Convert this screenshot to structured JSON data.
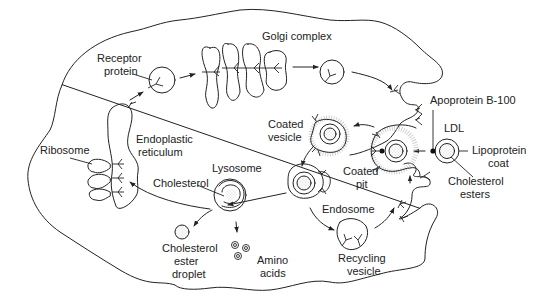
{
  "diagram": {
    "labels": {
      "receptor_protein": [
        "Receptor",
        "protein"
      ],
      "golgi_complex": "Golgi complex",
      "ribosome": "Ribosome",
      "endoplastic_reticulum": [
        "Endoplastic",
        "reticulum"
      ],
      "apoprotein": "Apoprotein B-100",
      "ldl": "LDL",
      "lipoprotein_coat": [
        "Lipoprotein",
        "coat"
      ],
      "cholesterol_esters": [
        "Cholesterol",
        "esters"
      ],
      "coated_vesicle": [
        "Coated",
        "vesicle"
      ],
      "coated_pit": [
        "Coated",
        "pit"
      ],
      "lysosome": "Lysosome",
      "cholesterol": "Cholesterol",
      "endosome": "Endosome",
      "cholesterol_ester_droplet": [
        "Cholesterol",
        "ester",
        "droplet"
      ],
      "amino_acids": [
        "Amino",
        "acids"
      ],
      "recycling_vesicle": [
        "Recycling",
        "vesicle"
      ]
    },
    "colors": {
      "line": "#222222",
      "background": "#ffffff",
      "stipple": "#9a9a9a"
    }
  }
}
